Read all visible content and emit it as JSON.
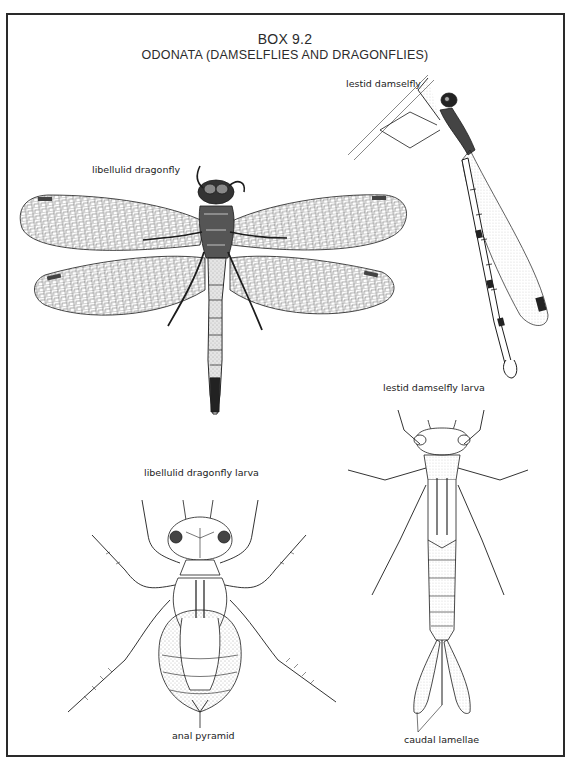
{
  "page": {
    "header_partial": "",
    "box_number": "BOX 9.2",
    "box_title": "ODONATA (DAMSELFLIES AND DRAGONFLIES)"
  },
  "figures": [
    {
      "id": "libellulid-dragonfly",
      "label": "libellulid dragonfly"
    },
    {
      "id": "lestid-damselfly",
      "label": "lestid damselfly"
    },
    {
      "id": "libellulid-dragonfly-larva",
      "label": "libellulid dragonfly larva"
    },
    {
      "id": "lestid-damselfly-larva",
      "label": "lestid damselfly larva"
    }
  ],
  "annotations": {
    "anal_pyramid": "anal pyramid",
    "caudal_lamellae": "caudal lamellae"
  },
  "colors": {
    "ink": "#1c1c1c",
    "frame": "#2a2a2a",
    "background": "#ffffff",
    "stipple": "#777777"
  }
}
